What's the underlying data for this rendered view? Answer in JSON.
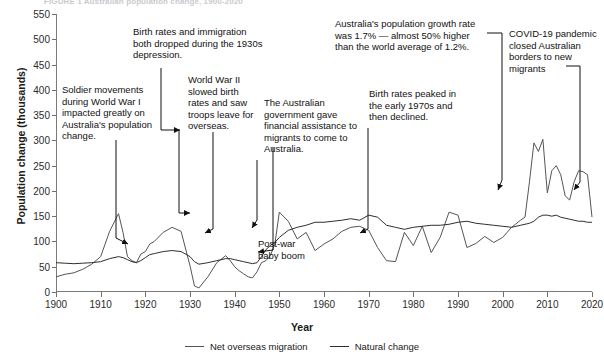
{
  "figure": {
    "title": "FIGURE 1 Australian population change, 1900-2020",
    "xlabel": "Year",
    "ylabel": "Population change (thousands)"
  },
  "legend": [
    {
      "key": "nom",
      "label": "Net overseas migration",
      "color": "#555555"
    },
    {
      "key": "nat",
      "label": "Natural change",
      "color": "#2f2f2f"
    }
  ],
  "annotations": [
    {
      "id": "ww1",
      "text": "Soldier movements during World War I impacted greatly on Australia's population change."
    },
    {
      "id": "depression",
      "text": "Birth rates and immigration both dropped during the 1930s depression."
    },
    {
      "id": "ww2",
      "text": "World War II slowed birth rates and saw troops leave for overseas."
    },
    {
      "id": "assisted-migration",
      "text": "The Australian government gave financial assistance to migrants to come to Australia."
    },
    {
      "id": "birth-peak",
      "text": "Birth rates peaked in the early 1970s and then declined."
    },
    {
      "id": "growth-rate",
      "text": "Australia's population growth rate was 1.7% — almost 50% higher than the world average of 1.2%."
    },
    {
      "id": "covid",
      "text": "COVID-19 pandemic closed Australian borders to new migrants"
    },
    {
      "id": "baby-boom",
      "text": "Post-war baby boom"
    }
  ],
  "chart_data": {
    "type": "line",
    "title": "Australian population change, 1900-2020",
    "xlabel": "Year",
    "ylabel": "Population change (thousands)",
    "xlim": [
      1900,
      2020
    ],
    "ylim": [
      0,
      550
    ],
    "yticks": [
      0,
      50,
      100,
      150,
      200,
      250,
      300,
      350,
      400,
      450,
      500,
      550
    ],
    "xticks": [
      1900,
      1910,
      1920,
      1930,
      1940,
      1950,
      1960,
      1970,
      1980,
      1990,
      2000,
      2010,
      2020
    ],
    "grid": false,
    "legend_position": "bottom",
    "x": [
      1900,
      1902,
      1904,
      1906,
      1908,
      1910,
      1912,
      1914,
      1915,
      1916,
      1917,
      1918,
      1919,
      1920,
      1921,
      1922,
      1924,
      1926,
      1928,
      1930,
      1931,
      1932,
      1934,
      1936,
      1938,
      1939,
      1940,
      1941,
      1942,
      1943,
      1944,
      1945,
      1946,
      1947,
      1948,
      1949,
      1950,
      1952,
      1954,
      1956,
      1958,
      1960,
      1962,
      1964,
      1966,
      1968,
      1970,
      1972,
      1974,
      1976,
      1978,
      1980,
      1982,
      1984,
      1986,
      1988,
      1990,
      1992,
      1994,
      1996,
      1998,
      2000,
      2002,
      2004,
      2005,
      2006,
      2007,
      2008,
      2009,
      2010,
      2011,
      2012,
      2013,
      2014,
      2015,
      2016,
      2017,
      2018,
      2019,
      2020
    ],
    "series": [
      {
        "name": "Net overseas migration",
        "color": "#555555",
        "values": [
          30,
          35,
          38,
          45,
          55,
          70,
          120,
          155,
          118,
          70,
          62,
          58,
          75,
          80,
          95,
          100,
          118,
          128,
          120,
          52,
          12,
          8,
          30,
          58,
          72,
          62,
          50,
          42,
          36,
          30,
          28,
          40,
          58,
          62,
          72,
          95,
          158,
          140,
          105,
          118,
          82,
          95,
          105,
          120,
          128,
          130,
          122,
          88,
          62,
          60,
          118,
          92,
          130,
          78,
          108,
          158,
          152,
          88,
          96,
          110,
          98,
          108,
          128,
          142,
          148,
          218,
          295,
          278,
          302,
          196,
          240,
          250,
          232,
          190,
          182,
          218,
          240,
          238,
          232,
          148
        ]
      },
      {
        "name": "Natural change",
        "color": "#2f2f2f",
        "values": [
          58,
          57,
          56,
          57,
          58,
          60,
          66,
          70,
          68,
          64,
          60,
          58,
          62,
          68,
          74,
          76,
          80,
          82,
          80,
          70,
          60,
          55,
          58,
          62,
          66,
          66,
          64,
          62,
          60,
          58,
          56,
          58,
          70,
          84,
          92,
          98,
          108,
          122,
          128,
          132,
          138,
          138,
          140,
          142,
          145,
          142,
          152,
          148,
          132,
          128,
          124,
          128,
          130,
          132,
          132,
          134,
          138,
          140,
          136,
          134,
          132,
          130,
          128,
          132,
          134,
          136,
          140,
          148,
          152,
          152,
          150,
          152,
          148,
          146,
          144,
          142,
          140,
          140,
          138,
          138
        ]
      }
    ]
  }
}
